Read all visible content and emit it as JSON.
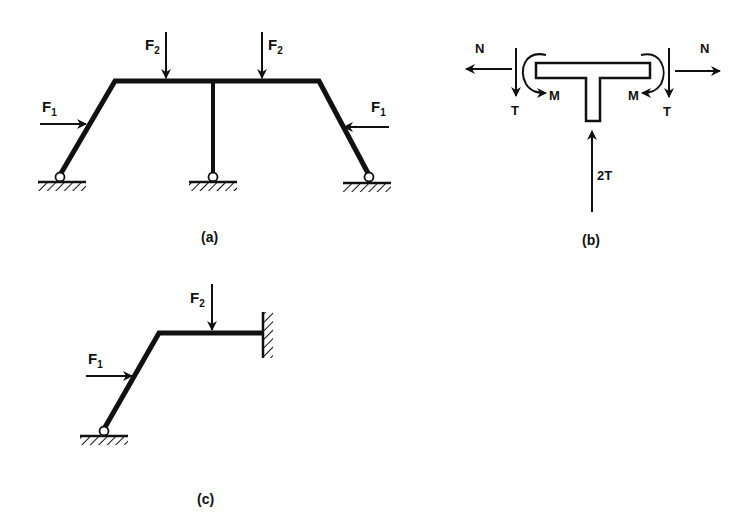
{
  "figure": {
    "panels": [
      {
        "id": "a",
        "caption": "(a)",
        "description": "Symmetric trapezoidal frame with central column, three pinned supports",
        "loads": [
          {
            "name": "F",
            "sub": "2",
            "position": "top beam left",
            "direction": "down"
          },
          {
            "name": "F",
            "sub": "2",
            "position": "top beam right",
            "direction": "down"
          },
          {
            "name": "F",
            "sub": "1",
            "position": "left inclined leg",
            "direction": "right"
          },
          {
            "name": "F",
            "sub": "1",
            "position": "right inclined leg",
            "direction": "left"
          }
        ],
        "supports": [
          "pin-left",
          "pin-center",
          "pin-right"
        ]
      },
      {
        "id": "b",
        "caption": "(b)",
        "description": "Free-body diagram of T-shaped joint",
        "forces": [
          {
            "label": "N",
            "side": "left",
            "direction": "left"
          },
          {
            "label": "N",
            "side": "right",
            "direction": "right"
          },
          {
            "label": "T",
            "side": "left",
            "direction": "down"
          },
          {
            "label": "T",
            "side": "right",
            "direction": "down"
          },
          {
            "label": "M",
            "side": "left",
            "type": "moment"
          },
          {
            "label": "M",
            "side": "right",
            "type": "moment"
          },
          {
            "label": "2T",
            "side": "bottom",
            "direction": "up"
          }
        ]
      },
      {
        "id": "c",
        "caption": "(c)",
        "description": "Half frame with pinned base and fixed wall support",
        "loads": [
          {
            "name": "F",
            "sub": "2",
            "position": "horizontal member",
            "direction": "down"
          },
          {
            "name": "F",
            "sub": "1",
            "position": "inclined leg",
            "direction": "right"
          }
        ],
        "supports": [
          "pin-base",
          "fixed-wall"
        ]
      }
    ],
    "labels": {
      "F": "F",
      "sub1": "1",
      "sub2": "2",
      "N": "N",
      "T": "T",
      "M": "M",
      "twoT": "2T",
      "cap_a": "(a)",
      "cap_b": "(b)",
      "cap_c": "(c)"
    },
    "colors": {
      "ink": "#111111",
      "background": "#ffffff"
    }
  }
}
